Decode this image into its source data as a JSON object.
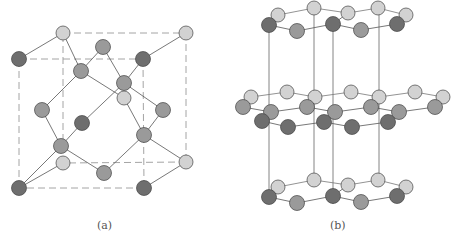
{
  "figure": {
    "panels": [
      {
        "id": "a",
        "label": "(a)",
        "structure": "diamond-cubic (zinc blende) unit cell"
      },
      {
        "id": "b",
        "label": "(b)",
        "structure": "hexagonal layered lattice"
      }
    ]
  },
  "colors": {
    "dark": "#6e6e6e",
    "medium": "#9a9a9a",
    "light": "#d2d2d2",
    "bond": "#555555",
    "cell_edge": "#9a9a9a"
  },
  "panel_a": {
    "cube": {
      "front": [
        [
          19,
          59
        ],
        [
          143,
          59
        ],
        [
          144,
          188
        ],
        [
          19,
          188
        ]
      ],
      "back": [
        [
          63,
          33
        ],
        [
          186,
          33
        ],
        [
          186,
          162
        ],
        [
          63,
          163
        ]
      ]
    },
    "atoms": [
      {
        "x": 63,
        "y": 33,
        "t": "light"
      },
      {
        "x": 186,
        "y": 33,
        "t": "light"
      },
      {
        "x": 103,
        "y": 47,
        "t": "medium"
      },
      {
        "x": 19,
        "y": 59,
        "t": "dark"
      },
      {
        "x": 143,
        "y": 59,
        "t": "dark"
      },
      {
        "x": 81,
        "y": 71,
        "t": "medium"
      },
      {
        "x": 124,
        "y": 98,
        "t": "light"
      },
      {
        "x": 124,
        "y": 83,
        "t": "medium"
      },
      {
        "x": 42,
        "y": 110,
        "t": "medium"
      },
      {
        "x": 163,
        "y": 110,
        "t": "medium"
      },
      {
        "x": 82,
        "y": 123,
        "t": "dark"
      },
      {
        "x": 144,
        "y": 135,
        "t": "medium"
      },
      {
        "x": 63,
        "y": 163,
        "t": "light"
      },
      {
        "x": 186,
        "y": 162,
        "t": "light"
      },
      {
        "x": 61,
        "y": 146,
        "t": "medium"
      },
      {
        "x": 104,
        "y": 173,
        "t": "medium"
      },
      {
        "x": 19,
        "y": 188,
        "t": "dark"
      },
      {
        "x": 144,
        "y": 188,
        "t": "dark"
      }
    ],
    "bonds": [
      [
        [
          63,
          33
        ],
        [
          81,
          71
        ]
      ],
      [
        [
          103,
          47
        ],
        [
          81,
          71
        ]
      ],
      [
        [
          103,
          47
        ],
        [
          124,
          83
        ]
      ],
      [
        [
          143,
          59
        ],
        [
          124,
          83
        ]
      ],
      [
        [
          81,
          71
        ],
        [
          42,
          110
        ]
      ],
      [
        [
          81,
          71
        ],
        [
          124,
          98
        ]
      ],
      [
        [
          124,
          83
        ],
        [
          82,
          123
        ]
      ],
      [
        [
          124,
          83
        ],
        [
          163,
          110
        ]
      ],
      [
        [
          42,
          110
        ],
        [
          61,
          146
        ]
      ],
      [
        [
          82,
          123
        ],
        [
          61,
          146
        ]
      ],
      [
        [
          61,
          146
        ],
        [
          19,
          188
        ]
      ],
      [
        [
          61,
          146
        ],
        [
          104,
          173
        ]
      ],
      [
        [
          163,
          110
        ],
        [
          144,
          135
        ]
      ],
      [
        [
          124,
          98
        ],
        [
          144,
          135
        ]
      ],
      [
        [
          144,
          135
        ],
        [
          186,
          162
        ]
      ],
      [
        [
          144,
          135
        ],
        [
          104,
          173
        ]
      ],
      [
        [
          19,
          59
        ],
        [
          63,
          33
        ]
      ],
      [
        [
          143,
          59
        ],
        [
          186,
          33
        ]
      ],
      [
        [
          19,
          188
        ],
        [
          63,
          163
        ]
      ],
      [
        [
          144,
          188
        ],
        [
          186,
          162
        ]
      ]
    ]
  },
  "panel_b": {
    "layers": [
      {
        "y_top": 13,
        "pts_back": [
          [
            278,
            15
          ],
          [
            314,
            8
          ],
          [
            348,
            13
          ],
          [
            378,
            8
          ],
          [
            406,
            15
          ]
        ],
        "pts_front": [
          [
            269,
            25
          ],
          [
            297,
            31
          ],
          [
            333,
            24
          ],
          [
            361,
            30
          ],
          [
            397,
            24
          ]
        ]
      },
      {
        "y_top": 92,
        "pts_back": [
          [
            251,
            97
          ],
          [
            287,
            92
          ],
          [
            315,
            97
          ],
          [
            351,
            92
          ],
          [
            379,
            97
          ],
          [
            415,
            92
          ],
          [
            443,
            97
          ]
        ],
        "pts_mid": [
          [
            243,
            107
          ],
          [
            271,
            112
          ],
          [
            307,
            107
          ],
          [
            335,
            112
          ],
          [
            371,
            107
          ],
          [
            399,
            112
          ],
          [
            435,
            107
          ]
        ],
        "pts_front": [
          [
            262,
            121
          ],
          [
            288,
            127
          ],
          [
            324,
            122
          ],
          [
            352,
            127
          ],
          [
            388,
            122
          ]
        ]
      }
    ],
    "verticals": [
      269,
      314,
      333,
      379
    ]
  }
}
